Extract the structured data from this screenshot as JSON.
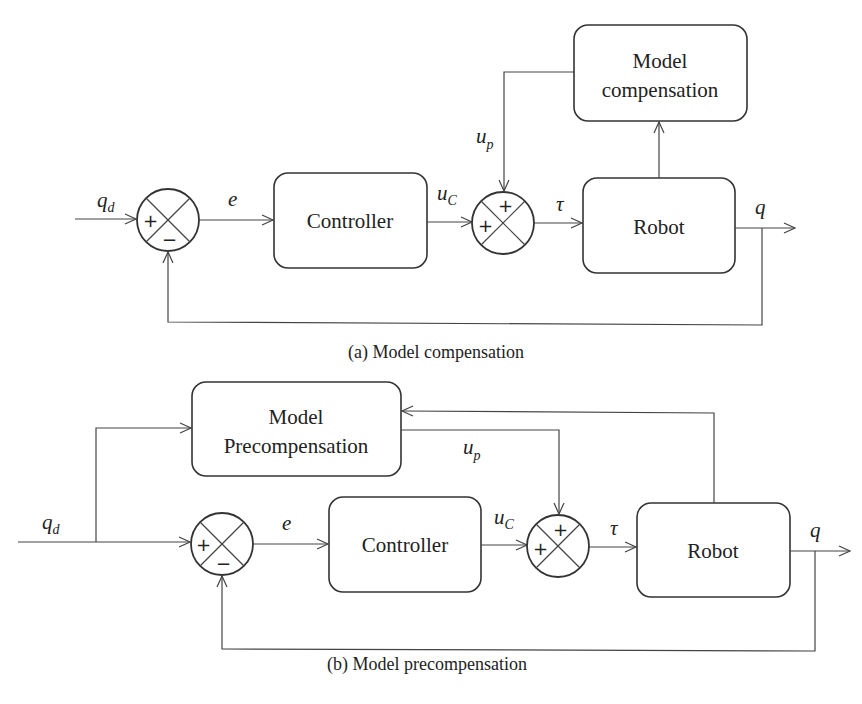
{
  "figure": {
    "panel_a": {
      "caption": "(a) Model compensation",
      "blocks": {
        "controller": "Controller",
        "robot": "Robot",
        "model_line1": "Model",
        "model_line2": "compensation"
      },
      "signals": {
        "qd": "q",
        "qd_sub": "d",
        "e": "e",
        "uc": "u",
        "uc_sub": "C",
        "up": "u",
        "up_sub": "p",
        "tau": "τ",
        "q": "q"
      },
      "summer1_signs": {
        "left": "+",
        "bottom": "−"
      },
      "summer2_signs": {
        "top": "+",
        "left": "+"
      }
    },
    "panel_b": {
      "caption": "(b) Model precompensation",
      "blocks": {
        "controller": "Controller",
        "robot": "Robot",
        "model_line1": "Model",
        "model_line2": "Precompensation"
      },
      "signals": {
        "qd": "q",
        "qd_sub": "d",
        "e": "e",
        "uc": "u",
        "uc_sub": "C",
        "up": "u",
        "up_sub": "p",
        "tau": "τ",
        "q": "q"
      },
      "summer1_signs": {
        "left": "+",
        "bottom": "−"
      },
      "summer2_signs": {
        "top": "+",
        "left": "+"
      }
    }
  }
}
